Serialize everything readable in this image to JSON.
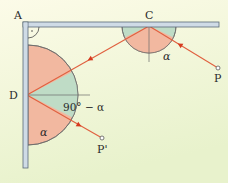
{
  "diagram": {
    "colors": {
      "background_top": "#fbfbe6",
      "background_bottom": "#e9f3cf",
      "mirror_fill": "#cfdbe6",
      "mirror_edge": "#5a6a78",
      "ray": "#e0603f",
      "arrow": "#d63a1e",
      "sector_salmon": "#f2b8a0",
      "sector_green": "#bfdcc6",
      "protractor_edge": "#6b6b6b"
    },
    "labels": {
      "corner": "A",
      "point_c": "C",
      "point_p": "P",
      "point_d": "D",
      "point_p_prime": "P'",
      "angle_at_c": "α",
      "angle_at_d_lower": "α",
      "angle_at_d_complement": "90° − α"
    },
    "points": {
      "A": [
        25,
        22
      ],
      "C": [
        149,
        26
      ],
      "P": [
        218,
        68
      ],
      "D": [
        27,
        95
      ],
      "P_prime": [
        102,
        138
      ]
    }
  }
}
